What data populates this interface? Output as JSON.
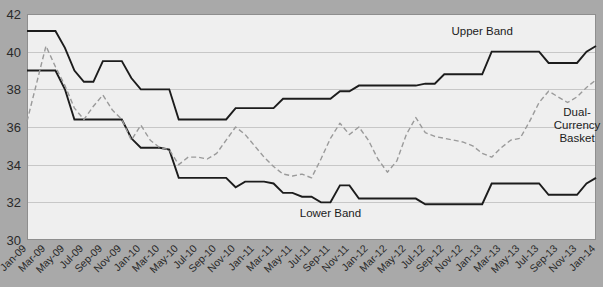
{
  "chart_data": {
    "type": "line",
    "title": "",
    "subtitle": "",
    "xlabel": "",
    "ylabel": "",
    "ylim": [
      30,
      42
    ],
    "y_ticks": [
      30,
      32,
      34,
      36,
      38,
      40,
      42
    ],
    "grid": true,
    "legend_position": "inline-annotations",
    "annotations": [
      {
        "name": "upper-band-label",
        "text": "Upper Band",
        "x": "Jan-13",
        "y": 40.9
      },
      {
        "name": "lower-band-label",
        "text": "Lower Band",
        "x": "Sep-11",
        "y": 31.2
      },
      {
        "name": "dual-currency-basket-label",
        "text": "Dual-\nCurrency\nBasket",
        "x": "Nov-13",
        "y": 36.6
      }
    ],
    "annotation_lines": {
      "dual_currency_basket": [
        "Dual-",
        "Currency",
        "Basket"
      ]
    },
    "categories": [
      "Jan-09",
      "Feb-09",
      "Mar-09",
      "Apr-09",
      "May-09",
      "Jun-09",
      "Jul-09",
      "Aug-09",
      "Sep-09",
      "Oct-09",
      "Nov-09",
      "Dec-09",
      "Jan-10",
      "Feb-10",
      "Mar-10",
      "Apr-10",
      "May-10",
      "Jun-10",
      "Jul-10",
      "Aug-10",
      "Sep-10",
      "Oct-10",
      "Nov-10",
      "Dec-10",
      "Jan-11",
      "Feb-11",
      "Mar-11",
      "Apr-11",
      "May-11",
      "Jun-11",
      "Jul-11",
      "Aug-11",
      "Sep-11",
      "Oct-11",
      "Nov-11",
      "Dec-11",
      "Jan-12",
      "Feb-12",
      "Mar-12",
      "Apr-12",
      "May-12",
      "Jun-12",
      "Jul-12",
      "Aug-12",
      "Sep-12",
      "Oct-12",
      "Nov-12",
      "Dec-12",
      "Jan-13",
      "Feb-13",
      "Mar-13",
      "Apr-13",
      "May-13",
      "Jun-13",
      "Jul-13",
      "Aug-13",
      "Sep-13",
      "Oct-13",
      "Nov-13",
      "Dec-13",
      "Jan-14"
    ],
    "x_tick_labels": [
      "Jan-09",
      "Mar-09",
      "May-09",
      "Jul-09",
      "Sep-09",
      "Nov-09",
      "Jan-10",
      "Mar-10",
      "May-10",
      "Jul-10",
      "Sep-10",
      "Nov-10",
      "Jan-11",
      "Mar-11",
      "May-11",
      "Jul-11",
      "Sep-11",
      "Nov-11",
      "Jan-12",
      "Mar-12",
      "May-12",
      "Jul-12",
      "Sep-12",
      "Nov-12",
      "Jan-13",
      "Mar-13",
      "May-13",
      "Jul-13",
      "Sep-13",
      "Nov-13",
      "Jan-14"
    ],
    "series": [
      {
        "name": "Upper Band",
        "color": "#1c1c1c",
        "style": "solid",
        "values": [
          41.1,
          41.1,
          41.1,
          41.1,
          40.2,
          39.0,
          38.4,
          38.4,
          39.5,
          39.5,
          39.5,
          38.6,
          38.0,
          38.0,
          38.0,
          38.0,
          36.4,
          36.4,
          36.4,
          36.4,
          36.4,
          36.4,
          37.0,
          37.0,
          37.0,
          37.0,
          37.0,
          37.5,
          37.5,
          37.5,
          37.5,
          37.5,
          37.5,
          37.9,
          37.9,
          38.2,
          38.2,
          38.2,
          38.2,
          38.2,
          38.2,
          38.2,
          38.3,
          38.3,
          38.8,
          38.8,
          38.8,
          38.8,
          38.8,
          40.0,
          40.0,
          40.0,
          40.0,
          40.0,
          40.0,
          39.4,
          39.4,
          39.4,
          39.4,
          40.0,
          40.3
        ]
      },
      {
        "name": "Lower Band",
        "color": "#1c1c1c",
        "style": "solid",
        "values": [
          39.0,
          39.0,
          39.0,
          39.0,
          38.0,
          36.4,
          36.4,
          36.4,
          36.4,
          36.4,
          36.4,
          35.4,
          34.9,
          34.9,
          34.9,
          34.8,
          33.3,
          33.3,
          33.3,
          33.3,
          33.3,
          33.3,
          32.8,
          33.1,
          33.1,
          33.1,
          33.0,
          32.5,
          32.5,
          32.3,
          32.3,
          32.0,
          32.0,
          32.9,
          32.9,
          32.2,
          32.2,
          32.2,
          32.2,
          32.2,
          32.2,
          32.2,
          31.9,
          31.9,
          31.9,
          31.9,
          31.9,
          31.9,
          31.9,
          33.0,
          33.0,
          33.0,
          33.0,
          33.0,
          33.0,
          32.4,
          32.4,
          32.4,
          32.4,
          33.0,
          33.3
        ]
      },
      {
        "name": "Dual-Currency Basket",
        "color": "#9a9a9a",
        "style": "dashed",
        "values": [
          36.3,
          38.3,
          40.3,
          39.2,
          38.2,
          37.0,
          36.4,
          37.1,
          37.7,
          36.9,
          36.4,
          35.3,
          36.1,
          35.3,
          34.9,
          34.8,
          34.0,
          34.4,
          34.4,
          34.3,
          34.6,
          35.3,
          36.0,
          35.6,
          35.0,
          34.4,
          33.9,
          33.5,
          33.4,
          33.5,
          33.3,
          34.3,
          35.4,
          36.2,
          35.6,
          36.0,
          35.3,
          34.3,
          33.6,
          34.2,
          35.6,
          36.5,
          35.7,
          35.5,
          35.4,
          35.3,
          35.2,
          35.0,
          34.6,
          34.4,
          34.9,
          35.3,
          35.4,
          36.3,
          37.3,
          37.9,
          37.6,
          37.3,
          37.6,
          38.1,
          38.5
        ]
      }
    ]
  },
  "axis": {
    "y_tick_texts": [
      "42",
      "40",
      "38",
      "36",
      "34",
      "32",
      "30"
    ]
  }
}
